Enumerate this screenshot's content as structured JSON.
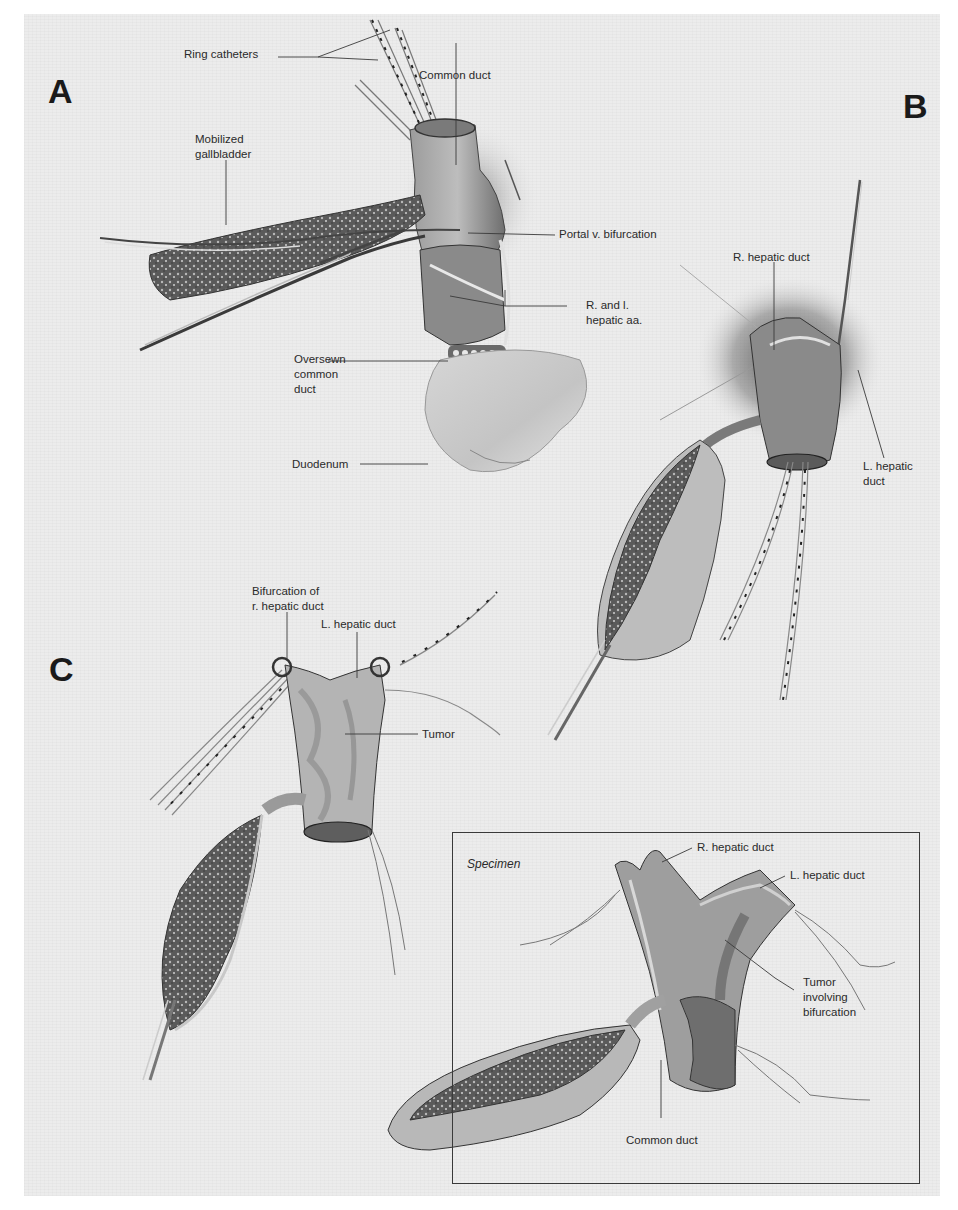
{
  "figure": {
    "panels": {
      "A": {
        "letter": "A",
        "labels": {
          "ring_catheters": "Ring catheters",
          "common_duct": "Common duct",
          "mobilized_gallbladder_1": "Mobilized",
          "mobilized_gallbladder_2": "gallbladder",
          "portal_v_bifurcation": "Portal v. bifurcation",
          "hepatic_aa_1": "R. and l.",
          "hepatic_aa_2": "hepatic aa.",
          "oversewn_1": "Oversewn",
          "oversewn_2": "common",
          "oversewn_3": "duct",
          "duodenum": "Duodenum"
        }
      },
      "B": {
        "letter": "B",
        "labels": {
          "r_hepatic_duct": "R. hepatic duct",
          "l_hepatic_duct_1": "L. hepatic",
          "l_hepatic_duct_2": "duct"
        }
      },
      "C": {
        "letter": "C",
        "labels": {
          "bifurcation_1": "Bifurcation of",
          "bifurcation_2": "r. hepatic duct",
          "l_hepatic_duct": "L. hepatic duct",
          "tumor": "Tumor"
        }
      },
      "specimen": {
        "title": "Specimen",
        "labels": {
          "r_hepatic_duct": "R. hepatic duct",
          "l_hepatic_duct": "L. hepatic duct",
          "tumor_1": "Tumor",
          "tumor_2": "involving",
          "tumor_3": "bifurcation",
          "common_duct": "Common duct"
        }
      }
    },
    "colors": {
      "paper": "#ececec",
      "ink": "#2a2a2a",
      "tissue_dark": "#5a5a5a",
      "tissue_mid": "#9a9a9a",
      "tissue_light": "#c8c8c8"
    }
  }
}
